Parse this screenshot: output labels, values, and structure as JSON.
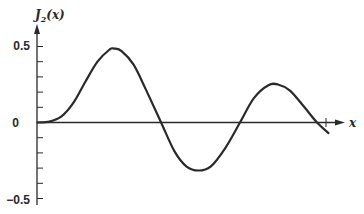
{
  "chart_data": {
    "type": "line",
    "title": "",
    "xlabel": "x",
    "ylabel": "J₂(x)",
    "ylabel_main": "J",
    "ylabel_sub": "2",
    "ylabel_arg": "(x)",
    "ylim": [
      -0.5,
      0.5
    ],
    "xlim": [
      0,
      12.1
    ],
    "grid": false,
    "legend": null,
    "y_tick_labels": [
      {
        "value": 0.5,
        "label": "0.5"
      },
      {
        "value": 0,
        "label": "0"
      },
      {
        "value": -0.5,
        "label": "-0.5",
        "display": "−0.5"
      }
    ],
    "y_minor_ticks": [
      0.4,
      0.3,
      0.2,
      0.1,
      -0.1,
      -0.2,
      -0.3,
      -0.4
    ],
    "x_end_tick": 12.1,
    "series": [
      {
        "name": "J₂(x)",
        "color": "#2a2a2a",
        "points": [
          [
            0,
            0
          ],
          [
            0.5,
            0.006
          ],
          [
            1,
            0.04
          ],
          [
            1.5,
            0.13
          ],
          [
            2,
            0.27
          ],
          [
            2.5,
            0.4
          ],
          [
            3.0,
            0.48
          ],
          [
            3.2,
            0.486
          ],
          [
            3.5,
            0.47
          ],
          [
            4,
            0.38
          ],
          [
            4.5,
            0.22
          ],
          [
            5.14,
            0
          ],
          [
            5.7,
            -0.19
          ],
          [
            6.2,
            -0.29
          ],
          [
            6.7,
            -0.316
          ],
          [
            7.2,
            -0.29
          ],
          [
            7.8,
            -0.17
          ],
          [
            8.42,
            0
          ],
          [
            9.0,
            0.16
          ],
          [
            9.6,
            0.245
          ],
          [
            10.0,
            0.25
          ],
          [
            10.5,
            0.21
          ],
          [
            11.1,
            0.1
          ],
          [
            11.62,
            0
          ],
          [
            12.1,
            -0.07
          ]
        ]
      }
    ]
  }
}
